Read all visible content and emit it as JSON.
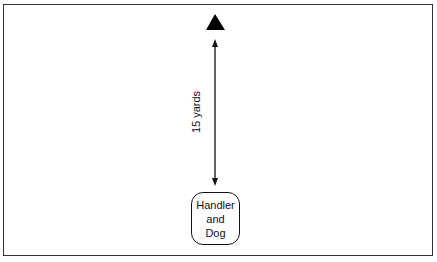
{
  "diagram": {
    "target_marker": "triangle",
    "distance_label": "15 yards",
    "start_box": {
      "lines": [
        "Handler",
        "and",
        "Dog"
      ]
    },
    "colors": {
      "stroke": "#111111",
      "frame": "#333333",
      "background": "#ffffff"
    }
  }
}
